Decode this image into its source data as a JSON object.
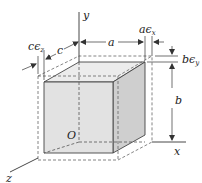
{
  "figure": {
    "colors": {
      "line": "#333333",
      "dashed": "#555555",
      "front_face": "#e2e2e2",
      "top_face": "#ececec",
      "side_face": "#cfcfcf"
    },
    "axes": {
      "x": "x",
      "y": "y",
      "z": "z",
      "origin": "O"
    },
    "dimensions": {
      "a": "a",
      "b": "b",
      "c": "c",
      "a_strain": "a",
      "a_strain_eps": "ϵ",
      "a_strain_sub": "x",
      "b_strain": "b",
      "b_strain_eps": "ϵ",
      "b_strain_sub": "y",
      "c_strain": "c",
      "c_strain_eps": "ϵ",
      "c_strain_sub": "z"
    }
  }
}
